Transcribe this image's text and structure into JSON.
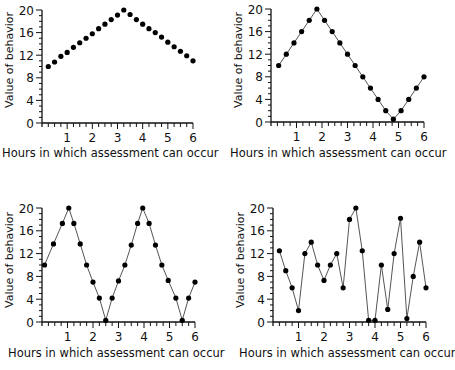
{
  "chart_data": [
    {
      "type": "scatter",
      "panel": "top-left",
      "title": "",
      "xlabel": "Hours in which assessment can occur",
      "ylabel": "Value of behavior",
      "xlim": [
        0,
        6
      ],
      "ylim": [
        0,
        20
      ],
      "xticks": [
        1,
        2,
        3,
        4,
        5,
        6
      ],
      "yticks": [
        0,
        4,
        8,
        12,
        16,
        20
      ],
      "x_minor_step": 0.25,
      "y_minor_step": 1,
      "connected": false,
      "x": [
        0.25,
        0.5,
        0.75,
        1.0,
        1.25,
        1.5,
        1.75,
        2.0,
        2.25,
        2.5,
        2.75,
        3.0,
        3.25,
        3.5,
        3.75,
        4.0,
        4.25,
        4.5,
        4.75,
        5.0,
        5.25,
        5.5,
        5.75,
        6.0
      ],
      "values": [
        10,
        10.8,
        11.8,
        12.5,
        13.4,
        14.2,
        15,
        15.8,
        16.7,
        17.5,
        18.3,
        19.1,
        20,
        19.2,
        18.3,
        17.5,
        16.7,
        16,
        15.2,
        14.3,
        13.5,
        12.7,
        11.9,
        11
      ]
    },
    {
      "type": "line",
      "panel": "top-right",
      "title": "",
      "xlabel": "Hours in which assessment can occur",
      "ylabel": "Value of behavior",
      "xlim": [
        0,
        6
      ],
      "ylim": [
        0,
        20
      ],
      "xticks": [
        1,
        2,
        3,
        4,
        5,
        6
      ],
      "yticks": [
        0,
        4,
        8,
        12,
        16,
        20
      ],
      "x_minor_step": 0.25,
      "y_minor_step": 1,
      "connected": true,
      "x": [
        0.3,
        0.6,
        0.9,
        1.2,
        1.5,
        1.8,
        2.1,
        2.4,
        2.7,
        3.0,
        3.3,
        3.6,
        3.9,
        4.2,
        4.5,
        4.8,
        5.1,
        5.4,
        5.7,
        6.0
      ],
      "values": [
        10,
        12,
        14,
        16,
        18,
        20,
        18,
        16,
        14,
        12,
        10,
        8,
        6,
        4,
        2,
        0.5,
        2,
        4,
        6,
        8
      ]
    },
    {
      "type": "line",
      "panel": "bottom-left",
      "title": "",
      "xlabel": "Hours in which assessment can occur",
      "ylabel": "Value of behavior",
      "xlim": [
        0,
        6
      ],
      "ylim": [
        0,
        20
      ],
      "xticks": [
        1,
        2,
        3,
        4,
        5,
        6
      ],
      "yticks": [
        0,
        4,
        8,
        12,
        16,
        20
      ],
      "x_minor_step": 0.25,
      "y_minor_step": 1,
      "connected": true,
      "x": [
        0.1,
        0.45,
        0.8,
        1.05,
        1.25,
        1.5,
        1.75,
        2.0,
        2.25,
        2.5,
        2.75,
        3.0,
        3.25,
        3.5,
        3.75,
        3.95,
        4.2,
        4.45,
        4.7,
        4.95,
        5.25,
        5.5,
        5.75,
        6.0
      ],
      "values": [
        10,
        13.7,
        17.3,
        20,
        17.3,
        13.7,
        10,
        7,
        4.2,
        0.3,
        4.2,
        7.2,
        10,
        13.5,
        17.3,
        20,
        17.3,
        13.5,
        10,
        7.3,
        4.2,
        0.3,
        4.2,
        7
      ]
    },
    {
      "type": "line",
      "panel": "bottom-right",
      "title": "",
      "xlabel": "Hours in which assessment can occur",
      "ylabel": "Value of behavior",
      "xlim": [
        0,
        6
      ],
      "ylim": [
        0,
        20
      ],
      "xticks": [
        1,
        2,
        3,
        4,
        5,
        6
      ],
      "yticks": [
        0,
        4,
        8,
        12,
        16,
        20
      ],
      "x_minor_step": 0.25,
      "y_minor_step": 1,
      "connected": true,
      "x": [
        0.25,
        0.5,
        0.75,
        1.0,
        1.25,
        1.5,
        1.75,
        2.0,
        2.25,
        2.5,
        2.75,
        3.0,
        3.25,
        3.5,
        3.75,
        4.0,
        4.25,
        4.5,
        4.75,
        5.0,
        5.25,
        5.5,
        5.75,
        6.0
      ],
      "values": [
        12.5,
        9,
        6,
        2,
        12,
        14,
        10,
        7.3,
        10,
        12,
        6,
        18,
        20,
        12.5,
        0.3,
        0.3,
        10,
        2.2,
        12,
        18.2,
        0.6,
        8,
        14,
        6
      ]
    }
  ],
  "colors": {
    "marker": "#000000",
    "line": "#555555",
    "axis": "#111111"
  }
}
